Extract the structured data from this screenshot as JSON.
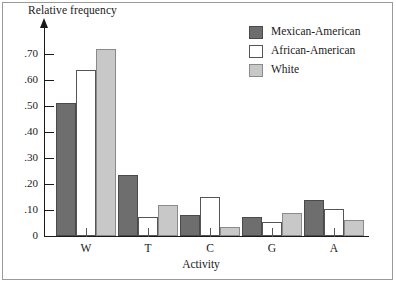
{
  "chart_data": {
    "type": "bar",
    "title": "",
    "xlabel": "Activity",
    "ylabel": "Relative frequency",
    "categories": [
      "W",
      "T",
      "C",
      "G",
      "A"
    ],
    "series": [
      {
        "name": "Mexican-American",
        "color": "#6e6e6e",
        "border": "#4a4a4a",
        "values": [
          0.51,
          0.235,
          0.08,
          0.075,
          0.14
        ]
      },
      {
        "name": "African-American",
        "color": "#ffffff",
        "border": "#555555",
        "values": [
          0.64,
          0.075,
          0.15,
          0.055,
          0.105
        ]
      },
      {
        "name": "White",
        "color": "#c8c8c8",
        "border": "#8a8a8a",
        "values": [
          0.72,
          0.12,
          0.035,
          0.09,
          0.06
        ]
      }
    ],
    "ylim": [
      0,
      0.78
    ],
    "yticks": [
      0,
      0.1,
      0.2,
      0.3,
      0.4,
      0.5,
      0.6,
      0.7
    ],
    "ytick_labels": [
      "0",
      ".10",
      ".20",
      ".30",
      ".40",
      ".50",
      ".60",
      ".70"
    ],
    "grid": false,
    "legend_position": "top-right"
  },
  "legend": {
    "entries": [
      {
        "label": "Mexican-American"
      },
      {
        "label": "African-American"
      },
      {
        "label": "White"
      }
    ]
  }
}
